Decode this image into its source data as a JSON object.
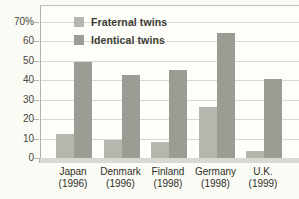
{
  "chart_data": {
    "type": "bar",
    "title": "",
    "categories": [
      {
        "name": "Japan",
        "year": "(1996)"
      },
      {
        "name": "Denmark",
        "year": "(1996)"
      },
      {
        "name": "Finland",
        "year": "(1998)"
      },
      {
        "name": "Germany",
        "year": "(1998)"
      },
      {
        "name": "U.K.",
        "year": "(1999)"
      }
    ],
    "series": [
      {
        "name": "Fraternal twins",
        "color": "#b6b6af",
        "values": [
          13,
          10,
          9,
          27,
          4
        ]
      },
      {
        "name": "Identical twins",
        "color": "#9c9c95",
        "values": [
          50,
          43,
          46,
          65,
          41
        ]
      }
    ],
    "xlabel": "",
    "ylabel": "",
    "ylim": [
      0,
      70
    ],
    "yticks": [
      0,
      10,
      20,
      30,
      40,
      50,
      60,
      70
    ],
    "ytick_labels": [
      "0",
      "10",
      "20",
      "30",
      "40",
      "50",
      "60",
      "70%"
    ],
    "grid": "horizontal",
    "legend_position": "top-left"
  },
  "colors": {
    "background": "#fbfbf5",
    "plot_background": "#fdfdf9",
    "gridline": "#d8d8d2",
    "axis": "#b3b3ac",
    "baseline_strip": "#d9d9d3",
    "tick_text": "#45453e",
    "label_text": "#2e2e27"
  }
}
